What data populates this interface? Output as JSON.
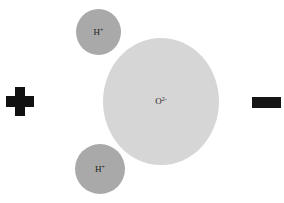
{
  "diagram": {
    "title": "",
    "nodes": [
      {
        "id": "oxygen",
        "label": "O",
        "charge": "2-",
        "color": "#d6d6d6"
      },
      {
        "id": "hydrogen-top",
        "label": "H",
        "charge": "+",
        "color": "#a9a9a9"
      },
      {
        "id": "hydrogen-bottom",
        "label": "H",
        "charge": "+",
        "color": "#a9a9a9"
      }
    ],
    "poles": {
      "left": {
        "symbol": "plus",
        "meaning": "positive pole"
      },
      "right": {
        "symbol": "minus",
        "meaning": "negative pole"
      }
    }
  }
}
